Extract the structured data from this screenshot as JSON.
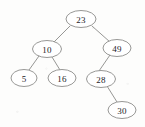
{
  "figure": {
    "name": "binary-search-tree",
    "background_color": "#fdfdfc",
    "node_fill_color": "#ffffff",
    "node_stroke_color": "#8c8c8a",
    "edge_color": "#8a8a88",
    "label_color": "#23221f"
  },
  "chart_data": {
    "type": "diagram",
    "diagram_kind": "binary-search-tree",
    "title": "",
    "xlabel": "",
    "ylabel": "",
    "nodes": [
      {
        "id": "n23",
        "label": "23",
        "cx": 81,
        "cy": 19,
        "rx": 15,
        "ry": 8.5,
        "depth": 0
      },
      {
        "id": "n10",
        "label": "10",
        "cx": 47,
        "cy": 49,
        "rx": 14.5,
        "ry": 8.5,
        "depth": 1
      },
      {
        "id": "n49",
        "label": "49",
        "cx": 117,
        "cy": 48,
        "rx": 14,
        "ry": 8.5,
        "depth": 1
      },
      {
        "id": "n5",
        "label": "5",
        "cx": 24,
        "cy": 78,
        "rx": 13,
        "ry": 8.5,
        "depth": 2
      },
      {
        "id": "n16",
        "label": "16",
        "cx": 62,
        "cy": 78,
        "rx": 14,
        "ry": 8.5,
        "depth": 2
      },
      {
        "id": "n28",
        "label": "28",
        "cx": 101,
        "cy": 79,
        "rx": 14.5,
        "ry": 8.5,
        "depth": 2
      },
      {
        "id": "n30",
        "label": "30",
        "cx": 122,
        "cy": 110,
        "rx": 14,
        "ry": 8.5,
        "depth": 3
      }
    ],
    "edges": [
      {
        "from": "n23",
        "to": "n10",
        "side": "left",
        "x1": 70,
        "y1": 26,
        "x2": 54,
        "y2": 42
      },
      {
        "from": "n23",
        "to": "n49",
        "side": "right",
        "x1": 92,
        "y1": 26,
        "x2": 110,
        "y2": 42
      },
      {
        "from": "n10",
        "to": "n5",
        "side": "left",
        "x1": 39,
        "y1": 56,
        "x2": 29,
        "y2": 70
      },
      {
        "from": "n10",
        "to": "n16",
        "side": "right",
        "x1": 52,
        "y1": 57,
        "x2": 60,
        "y2": 70
      },
      {
        "from": "n49",
        "to": "n28",
        "side": "left",
        "x1": 110,
        "y1": 55,
        "x2": 99,
        "y2": 71
      },
      {
        "from": "n28",
        "to": "n30",
        "side": "right",
        "x1": 107,
        "y1": 86,
        "x2": 117,
        "y2": 102
      }
    ],
    "values": [
      23,
      10,
      49,
      5,
      16,
      28,
      30
    ],
    "root": "23",
    "node_count": 7,
    "tree_height": 3
  }
}
